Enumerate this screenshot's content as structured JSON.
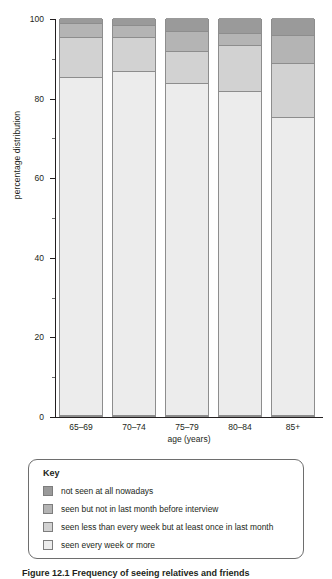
{
  "figure": {
    "caption": "Figure 12.1 Frequency of seeing relatives and friends"
  },
  "chart_data": {
    "type": "bar",
    "stacked": true,
    "title": "",
    "xlabel": "age (years)",
    "ylabel": "percentage distribution",
    "categories": [
      "65–69",
      "70–74",
      "75–79",
      "80–84",
      "85+"
    ],
    "ylim": [
      0,
      100
    ],
    "yticks": [
      0,
      20,
      40,
      60,
      80,
      100
    ],
    "ytick_labels": [
      "0",
      "20",
      "40",
      "60",
      "80",
      "100"
    ],
    "yminor_ticks": [
      10,
      30,
      50,
      70,
      90
    ],
    "grid": false,
    "legend_position": "below-plot",
    "series": [
      {
        "name": "seen every week or more",
        "color": "#ececec",
        "values": [
          85,
          86.5,
          83.5,
          81.5,
          75
        ]
      },
      {
        "name": "seen less than every week but at least once in last month",
        "color": "#d2d2d2",
        "values": [
          10,
          8.5,
          8,
          11.5,
          13.5
        ]
      },
      {
        "name": "seen but not in last month before interview",
        "color": "#b4b4b4",
        "values": [
          3.5,
          3,
          5,
          3,
          7
        ]
      },
      {
        "name": "not seen at all nowadays",
        "color": "#9a9a9a",
        "values": [
          1.5,
          2,
          3.5,
          4,
          4.5
        ]
      }
    ],
    "cumulative_tops": {
      "65–69": [
        85,
        95,
        98.5,
        100
      ],
      "70–74": [
        86.5,
        95,
        98,
        100
      ],
      "75–79": [
        83.5,
        91.5,
        96.5,
        100
      ],
      "80–84": [
        81.5,
        93,
        96,
        100
      ],
      "85+": [
        75,
        88.5,
        95.5,
        100
      ]
    }
  },
  "key": {
    "title": "Key",
    "items": [
      {
        "label": "not seen at all nowadays",
        "color": "#9a9a9a"
      },
      {
        "label": "seen but not in last month before interview",
        "color": "#b4b4b4"
      },
      {
        "label": "seen less than every week but at least once in last month",
        "color": "#d2d2d2"
      },
      {
        "label": "seen every week or more",
        "color": "#ececec"
      }
    ]
  }
}
